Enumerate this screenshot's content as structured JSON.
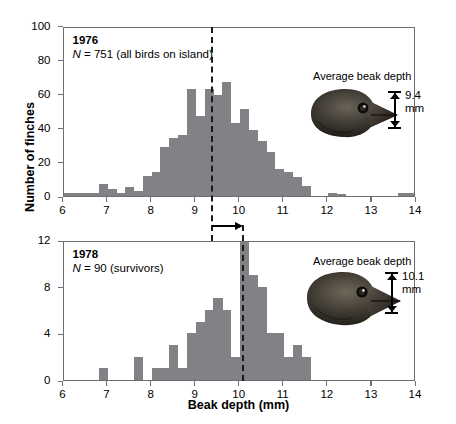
{
  "figure": {
    "ylabel": "Number of finches",
    "xlabel": "Beak depth (mm)"
  },
  "chart_data": [
    {
      "type": "bar",
      "id": "panel-1976",
      "title": "1976",
      "subtitle": "N = 751 (all birds on island)",
      "n_label_prefix": "N",
      "n_label_rest": " = 751 (all birds on island)",
      "xlabel": "Beak depth (mm)",
      "ylabel": "Number of finches",
      "xlim": [
        6,
        14
      ],
      "ylim": [
        0,
        100
      ],
      "xticks": [
        6,
        7,
        8,
        9,
        10,
        11,
        12,
        13,
        14
      ],
      "yticks": [
        0,
        20,
        40,
        60,
        80,
        100
      ],
      "grid": false,
      "bin_width": 0.2,
      "bar_color": "#808285",
      "mean_line": {
        "value": 9.4,
        "style": "dashed",
        "color": "#1a1a1a"
      },
      "annotation": {
        "text": "Average beak depth",
        "beak_depth_value": "9.4",
        "beak_depth_unit": "mm"
      },
      "bins": [
        6.0,
        6.2,
        6.4,
        6.6,
        6.8,
        7.0,
        7.2,
        7.4,
        7.6,
        7.8,
        8.0,
        8.2,
        8.4,
        8.6,
        8.8,
        9.0,
        9.2,
        9.4,
        9.6,
        9.8,
        10.0,
        10.2,
        10.4,
        10.6,
        10.8,
        11.0,
        11.2,
        11.4,
        11.6,
        11.8,
        12.0,
        12.2,
        12.4,
        12.6,
        12.8,
        13.0,
        13.2,
        13.4,
        13.6,
        13.8
      ],
      "values": [
        2,
        2,
        2,
        2,
        7,
        4,
        2,
        5,
        3,
        12,
        14,
        29,
        34,
        36,
        63,
        47,
        63,
        59,
        67,
        43,
        51,
        39,
        32,
        26,
        16,
        14,
        11,
        6,
        0,
        0,
        2,
        1,
        0,
        0,
        0,
        0,
        0,
        0,
        2,
        2
      ]
    },
    {
      "type": "bar",
      "id": "panel-1978",
      "title": "1978",
      "subtitle": "N = 90 (survivors)",
      "n_label_prefix": "N",
      "n_label_rest": " = 90 (survivors)",
      "xlabel": "Beak depth (mm)",
      "ylabel": "Number of finches",
      "xlim": [
        6,
        14
      ],
      "ylim": [
        0,
        12
      ],
      "xticks": [
        6,
        7,
        8,
        9,
        10,
        11,
        12,
        13,
        14
      ],
      "yticks": [
        0,
        4,
        8,
        12
      ],
      "grid": false,
      "bin_width": 0.2,
      "bar_color": "#808285",
      "mean_line": {
        "value": 10.1,
        "style": "dashed",
        "color": "#1a1a1a"
      },
      "annotation": {
        "text": "Average beak depth",
        "beak_depth_value": "10.1",
        "beak_depth_unit": "mm"
      },
      "bins": [
        6.0,
        6.2,
        6.4,
        6.6,
        6.8,
        7.0,
        7.2,
        7.4,
        7.6,
        7.8,
        8.0,
        8.2,
        8.4,
        8.6,
        8.8,
        9.0,
        9.2,
        9.4,
        9.6,
        9.8,
        10.0,
        10.2,
        10.4,
        10.6,
        10.8,
        11.0,
        11.2,
        11.4,
        11.6,
        11.8,
        12.0,
        12.2,
        12.4,
        12.6,
        12.8,
        13.0,
        13.2,
        13.4,
        13.6,
        13.8
      ],
      "values": [
        0,
        0,
        0,
        0,
        1,
        0,
        0,
        0,
        2,
        0,
        1,
        1,
        3,
        1,
        4,
        5,
        6,
        7,
        6,
        2,
        12,
        9,
        8,
        4,
        4,
        2,
        3,
        2,
        0,
        0,
        0,
        0,
        0,
        0,
        0,
        0,
        0,
        0,
        0,
        0
      ]
    }
  ],
  "shift_arrow": {
    "from_value": 9.4,
    "to_value": 10.1,
    "label": ""
  }
}
